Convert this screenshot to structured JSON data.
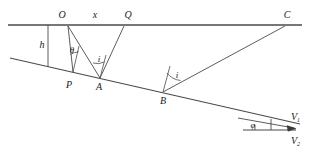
{
  "figure": {
    "stroke_color": "#3a3a3a",
    "label_color": "#1a1a1a",
    "labels": {
      "O": "O",
      "x": "x",
      "Q": "Q",
      "C": "C",
      "h": "h",
      "theta": "θ",
      "i_left": "i",
      "i_mid": "i",
      "P": "P",
      "A": "A",
      "B": "B",
      "phi": "φ",
      "V1": "V",
      "V1_sub": "1",
      "V2": "V",
      "V2_sub": "2"
    },
    "geometry": {
      "surface_line": {
        "x1": 8,
        "y1": 25,
        "x2": 302,
        "y2": 25
      },
      "interface_line": {
        "x1": 10,
        "y1": 58,
        "x2": 300,
        "y2": 124
      },
      "point_O": {
        "x": 68,
        "y": 26
      },
      "point_Q": {
        "x": 124,
        "y": 26
      },
      "point_C": {
        "x": 285,
        "y": 26
      },
      "point_P": {
        "x": 73,
        "y": 72
      },
      "point_A": {
        "x": 100,
        "y": 78
      },
      "point_B": {
        "x": 163,
        "y": 92
      },
      "h_foot": {
        "x": 48,
        "y": 67
      },
      "velocity_apex": {
        "x": 296,
        "y": 127
      },
      "velocity_base": {
        "x": 243,
        "y": 130
      }
    }
  }
}
